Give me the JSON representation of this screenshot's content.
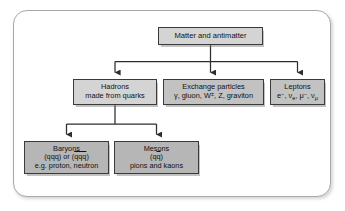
{
  "diagram": {
    "frame": {
      "border_color": "#a9a9a9"
    },
    "nodes": {
      "root": {
        "name": "Matter and antimatter",
        "lines": [
          "Matter and antimatter"
        ],
        "fill": "#d4d4d4"
      },
      "hadrons": {
        "name": "Hadrons",
        "lines": [
          "Hadrons",
          "made from quarks"
        ],
        "fill": "#d4d4d4"
      },
      "exchange": {
        "name": "Exchange particles",
        "lines": [
          "Exchange particles",
          "γ, gluon, W±, Z, graviton"
        ],
        "line1": "Exchange particles",
        "fill": "#c2c2c2"
      },
      "leptons": {
        "name": "Leptons",
        "lines": [
          "Leptons",
          "e−, νe, μ−, νμ"
        ],
        "line1": "Leptons",
        "fill": "#c2c2c2"
      },
      "baryons": {
        "name": "Baryons",
        "line1": "Baryons",
        "line3": "e.g. proton, neutron",
        "fill": "#b6b6b6"
      },
      "mesons": {
        "name": "Mesons",
        "line1": "Mesons",
        "line3": "pions and kaons",
        "fill": "#b6b6b6"
      }
    },
    "symbols": {
      "gamma": "γ,",
      "gluon": "gluon,",
      "w_boson": "W",
      "w_charge": "±",
      "z_boson": ", Z, graviton",
      "electron": "e",
      "electron_charge": "−",
      "nu_e": ", ν",
      "nu_e_sub": "e",
      "muon": ", μ",
      "muon_charge": "−",
      "nu_mu": ", ν",
      "nu_mu_sub": "μ",
      "qqq_open": "(qqq) or (",
      "qqq_bar": "qqq",
      "qqq_close": ")",
      "qq_open": "(",
      "qq_q": "q",
      "qq_bar": "q",
      "qq_close": ")"
    },
    "edges": {
      "root_to_tier2": "root splits to Hadrons, Exchange particles, Leptons",
      "hadrons_to_tier3": "Hadrons splits to Baryons and Mesons"
    }
  }
}
